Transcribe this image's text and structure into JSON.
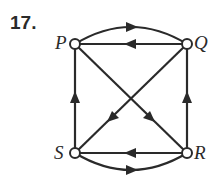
{
  "problem_number": "17.",
  "nodes": {
    "P": {
      "label": "P"
    },
    "Q": {
      "label": "Q"
    },
    "R": {
      "label": "R"
    },
    "S": {
      "label": "S"
    }
  },
  "edges": [
    {
      "from": "P",
      "to": "Q",
      "shape": "curved-top"
    },
    {
      "from": "Q",
      "to": "P",
      "shape": "straight"
    },
    {
      "from": "S",
      "to": "R",
      "shape": "curved-bottom"
    },
    {
      "from": "R",
      "to": "S",
      "shape": "straight"
    },
    {
      "from": "S",
      "to": "P",
      "shape": "straight"
    },
    {
      "from": "R",
      "to": "Q",
      "shape": "straight"
    },
    {
      "from": "P",
      "to": "R",
      "shape": "diagonal"
    },
    {
      "from": "Q",
      "to": "S",
      "shape": "diagonal"
    }
  ]
}
